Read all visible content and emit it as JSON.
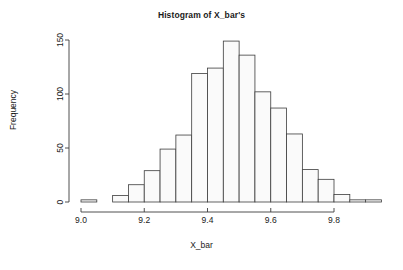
{
  "chart_data": {
    "type": "bar",
    "subtype": "histogram",
    "title": "Histogram of X_bar's",
    "xlabel": "X_bar",
    "ylabel": "Frequency",
    "grid": false,
    "legend": false,
    "bin_width": 0.05,
    "bin_starts": [
      9.0,
      9.05,
      9.1,
      9.15,
      9.2,
      9.25,
      9.3,
      9.35,
      9.4,
      9.45,
      9.5,
      9.55,
      9.6,
      9.65,
      9.7,
      9.75,
      9.8,
      9.85,
      9.9
    ],
    "categories": [
      "9.00-9.05",
      "9.05-9.10",
      "9.10-9.15",
      "9.15-9.20",
      "9.20-9.25",
      "9.25-9.30",
      "9.30-9.35",
      "9.35-9.40",
      "9.40-9.45",
      "9.45-9.50",
      "9.50-9.55",
      "9.55-9.60",
      "9.60-9.65",
      "9.65-9.70",
      "9.70-9.75",
      "9.75-9.80",
      "9.80-9.85",
      "9.85-9.90",
      "9.90-9.95"
    ],
    "values": [
      2,
      0,
      6,
      16,
      29,
      49,
      62,
      119,
      124,
      149,
      136,
      102,
      87,
      63,
      30,
      21,
      7,
      2,
      2
    ],
    "xlim": [
      8.98,
      9.96
    ],
    "ylim": [
      0,
      155
    ],
    "xticks": [
      9.0,
      9.2,
      9.4,
      9.6,
      9.8
    ],
    "xtick_labels": [
      "9.0",
      "9.2",
      "9.4",
      "9.6",
      "9.8"
    ],
    "yticks": [
      0,
      50,
      100,
      150
    ],
    "ytick_labels": [
      "0",
      "50",
      "100",
      "150"
    ],
    "bar_fill": "#fafafa",
    "bar_stroke": "#3c3c3c",
    "axis_color": "#3c3c3c"
  }
}
